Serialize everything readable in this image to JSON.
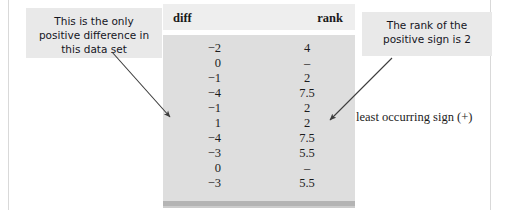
{
  "table": {
    "columns": [
      "diff",
      "rank"
    ],
    "header_diff": "diff",
    "header_rank": "rank",
    "rows": [
      {
        "diff": "−2",
        "rank": "4"
      },
      {
        "diff": "0",
        "rank": "–"
      },
      {
        "diff": "−1",
        "rank": "2"
      },
      {
        "diff": "−4",
        "rank": "7.5"
      },
      {
        "diff": "−1",
        "rank": "2"
      },
      {
        "diff": "1",
        "rank": "2"
      },
      {
        "diff": "−4",
        "rank": "7.5"
      },
      {
        "diff": "−3",
        "rank": "5.5"
      },
      {
        "diff": "0",
        "rank": "–"
      },
      {
        "diff": "−3",
        "rank": "5.5"
      }
    ]
  },
  "annotations": {
    "left_callout": "This is the only positive difference in this data set",
    "right_callout": "The rank of the positive sign is 2",
    "least_note": "least occurring sign (+)"
  },
  "colors": {
    "table_header_bg": "#eeeeee",
    "table_body_bg": "#dedede",
    "table_shadow": "#b4b4b4",
    "callout_bg": "#e9e9e9",
    "text": "#1c1c1c",
    "arrow": "#3c3c3c",
    "frame_line": "#d9d9d9"
  }
}
